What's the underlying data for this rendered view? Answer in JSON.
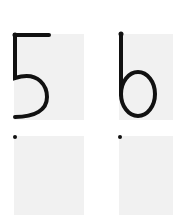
{
  "worksheet": {
    "digits": [
      {
        "label": "5",
        "row": "model",
        "column": 1
      },
      {
        "label": "6",
        "row": "model",
        "column": 2
      }
    ],
    "practice_boxes": [
      {
        "column": 1,
        "start_dot": true
      },
      {
        "column": 2,
        "start_dot": true
      }
    ],
    "colors": {
      "box": "#f1f1f1",
      "stroke": "#111111"
    }
  }
}
